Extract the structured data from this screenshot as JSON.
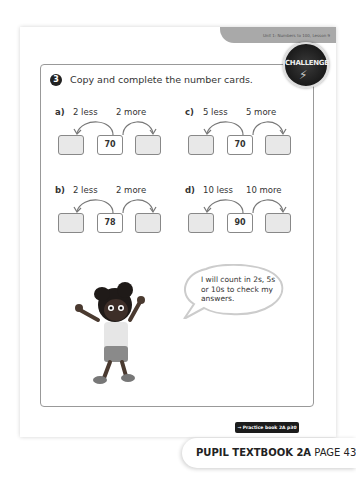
{
  "header": {
    "unit_text": "Unit 1: Numbers to 100, Lesson 9"
  },
  "question": {
    "number": "3",
    "title": "Copy and complete the number cards.",
    "badge": "CHALLENGE"
  },
  "parts": [
    {
      "letter": "a)",
      "less": "2 less",
      "more": "2 more",
      "value": "70"
    },
    {
      "letter": "b)",
      "less": "2 less",
      "more": "2 more",
      "value": "78"
    },
    {
      "letter": "c)",
      "less": "5 less",
      "more": "5 more",
      "value": "70"
    },
    {
      "letter": "d)",
      "less": "10 less",
      "more": "10 more",
      "value": "90"
    }
  ],
  "speech": {
    "text": "I will count in 2s, 5s or 10s to check my answers."
  },
  "footer": {
    "practice_link": "→ Practice book 2A p30",
    "page_number": "43",
    "book_title": "PUPIL TEXTBOOK 2A",
    "page_label": "PAGE 43"
  }
}
